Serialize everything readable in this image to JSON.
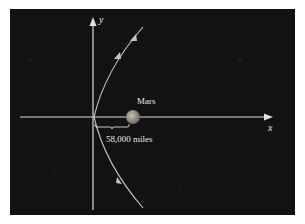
{
  "diagram": {
    "background_color": "#111111",
    "axis_color": "#d8d8d8",
    "curve_color": "#c9c2b8",
    "planet_color": "#a9a9a9",
    "labels": {
      "y_axis": "y",
      "x_axis": "x",
      "planet": "Mars",
      "distance": "58,000 miles"
    }
  }
}
